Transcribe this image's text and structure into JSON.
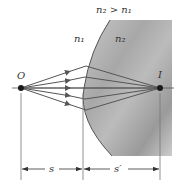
{
  "diagram": {
    "condition_label": "n₂ > n₁",
    "medium1_label": "n₁",
    "medium2_label": "n₂",
    "object_label": "O",
    "image_label": "I",
    "object_distance_label": "s",
    "image_distance_label": "s′",
    "ray_count": 5,
    "colors": {
      "background": "#ffffff",
      "medium2_fill": "#a9a9a9",
      "ray": "#555555",
      "line": "#666666",
      "point": "#1a1a1a"
    }
  }
}
